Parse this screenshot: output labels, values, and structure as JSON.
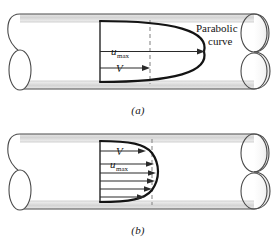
{
  "figure": {
    "panels": [
      {
        "id": "a",
        "caption": "(a)",
        "flow_type": "laminar",
        "profile_shape": "parabolic",
        "annotation_label": "Parabolic",
        "annotation_label_line2": "curve",
        "velocity_labels": [
          {
            "name": "u-max",
            "text": "u",
            "subscript": "max"
          },
          {
            "name": "v-average",
            "text": "V",
            "subscript": ""
          }
        ],
        "dashed_line": true,
        "arrow_count": 2
      },
      {
        "id": "b",
        "caption": "(b)",
        "flow_type": "turbulent",
        "profile_shape": "blunt",
        "annotation_label": "",
        "annotation_label_line2": "",
        "velocity_labels": [
          {
            "name": "v-average",
            "text": "V",
            "subscript": ""
          },
          {
            "name": "u-max",
            "text": "u",
            "subscript": "max"
          }
        ],
        "dashed_line": true,
        "arrow_count": 6
      }
    ]
  },
  "colors": {
    "line": "#141414",
    "pipe_outline": "#4a4a4a",
    "pipe_band": "#d8d8d8",
    "pipe_band_light": "#eaeaea",
    "pipe_interior": "#ffffff",
    "dashed": "#8a8a8a",
    "arrow": "#2a2a2a",
    "text": "#141414",
    "background": "#ffffff"
  }
}
